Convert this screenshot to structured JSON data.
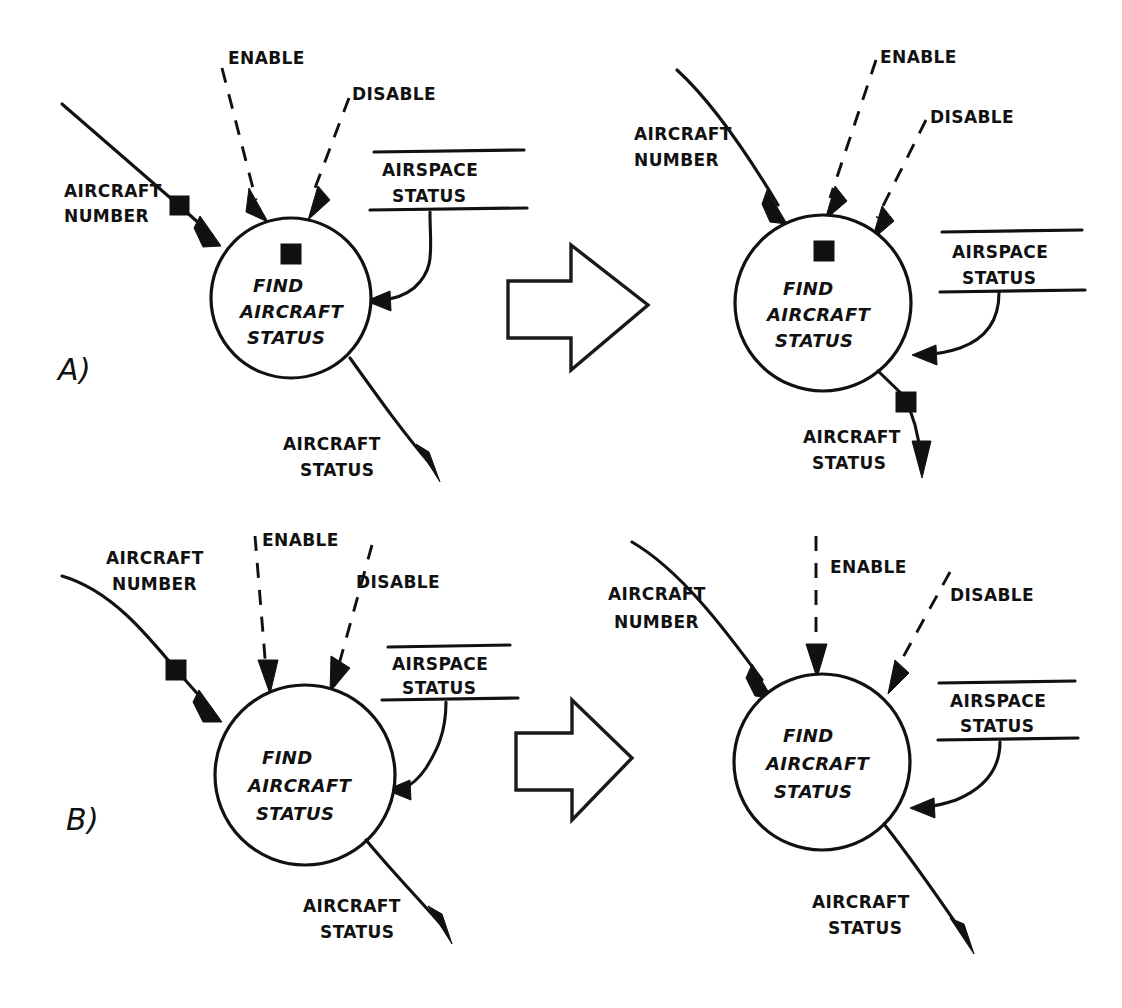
{
  "diagram": {
    "panels": [
      {
        "id": "A",
        "panel_label": "A)",
        "before": {
          "process_label_line1": "FIND",
          "process_label_line2": "AIRCRAFT",
          "process_label_line3": "STATUS",
          "inputs": {
            "aircraft_number": "AIRCRAFT\nNUMBER",
            "aircraft_number_line1": "AIRCRAFT",
            "aircraft_number_line2": "NUMBER",
            "enable": "ENABLE",
            "disable": "DISABLE"
          },
          "datastore": {
            "line1": "AIRSPACE",
            "line2": "STATUS"
          },
          "output": {
            "line1": "AIRCRAFT",
            "line2": "STATUS"
          },
          "tokens": [
            {
              "name": "token-on-aircraft-number-flow",
              "x": 178,
              "y": 204
            },
            {
              "name": "token-inside-process",
              "x": 290,
              "y": 253
            }
          ]
        },
        "after": {
          "process_label_line1": "FIND",
          "process_label_line2": "AIRCRAFT",
          "process_label_line3": "STATUS",
          "inputs": {
            "aircraft_number_line1": "AIRCRAFT",
            "aircraft_number_line2": "NUMBER",
            "enable": "ENABLE",
            "disable": "DISABLE"
          },
          "datastore": {
            "line1": "AIRSPACE",
            "line2": "STATUS"
          },
          "output": {
            "line1": "AIRCRAFT",
            "line2": "STATUS"
          },
          "tokens": [
            {
              "name": "token-inside-process",
              "x": 824,
              "y": 250
            },
            {
              "name": "token-on-aircraft-status-output",
              "x": 905,
              "y": 401
            }
          ]
        },
        "transition_arrow": "block-arrow-right"
      },
      {
        "id": "B",
        "panel_label": "B)",
        "before": {
          "process_label_line1": "FIND",
          "process_label_line2": "AIRCRAFT",
          "process_label_line3": "STATUS",
          "inputs": {
            "aircraft_number_line1": "AIRCRAFT",
            "aircraft_number_line2": "NUMBER",
            "enable": "ENABLE",
            "disable": "DISABLE"
          },
          "datastore": {
            "line1": "AIRSPACE",
            "line2": "STATUS"
          },
          "output": {
            "line1": "AIRCRAFT",
            "line2": "STATUS"
          },
          "tokens": [
            {
              "name": "token-on-aircraft-number-flow",
              "x": 175,
              "y": 670
            }
          ]
        },
        "after": {
          "process_label_line1": "FIND",
          "process_label_line2": "AIRCRAFT",
          "process_label_line3": "STATUS",
          "inputs": {
            "aircraft_number_line1": "AIRCRAFT",
            "aircraft_number_line2": "NUMBER",
            "enable": "ENABLE",
            "disable": "DISABLE"
          },
          "datastore": {
            "line1": "AIRSPACE",
            "line2": "STATUS"
          },
          "output": {
            "line1": "AIRCRAFT",
            "line2": "STATUS"
          },
          "tokens": []
        },
        "transition_arrow": "block-arrow-right"
      }
    ],
    "colors": {
      "ink": "#111111",
      "paper": "#ffffff"
    }
  }
}
